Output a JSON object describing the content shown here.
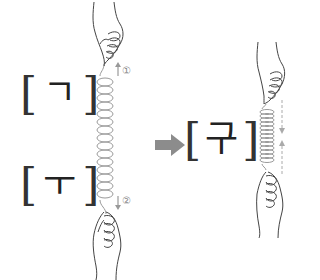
{
  "diagram": {
    "title": "",
    "left_top_label": {
      "open": "[",
      "char": "ㄱ",
      "close": "]"
    },
    "left_bottom_label": {
      "open": "[",
      "char": "ㅜ",
      "close": "]"
    },
    "result_label": {
      "open": "[",
      "char": "구",
      "close": "]"
    },
    "annotations": {
      "step1": "①",
      "step2": "②"
    },
    "icons": {
      "left_spring": "stretched-spring-icon",
      "right_spring": "compressed-spring-icon",
      "arrow": "right-arrow-icon",
      "hands": "hand-icon"
    },
    "colors": {
      "spring": "#9a9a9a",
      "arrow": "#8c8c8c",
      "text": "#222222",
      "annotation": "#999999"
    }
  }
}
